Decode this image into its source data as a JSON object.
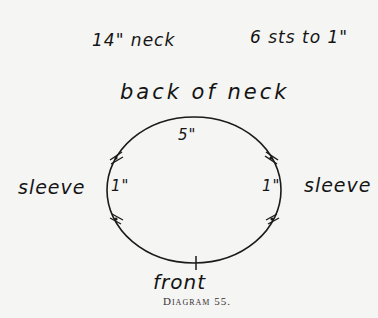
{
  "notes": {
    "neck_size": "14\" neck",
    "gauge": "6 sts to 1\""
  },
  "diagram": {
    "top_label": "back of neck",
    "back_measure": "5\"",
    "left_measure": "1\"",
    "right_measure": "1\"",
    "left_label": "sleeve",
    "right_label": "sleeve",
    "bottom_label": "front",
    "caption": "Diagram 55."
  }
}
